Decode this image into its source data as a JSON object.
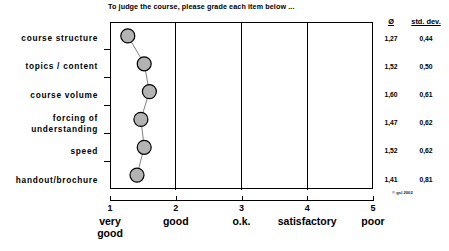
{
  "chart_data": {
    "type": "line",
    "title": "To judge the course, please grade each item below ...",
    "xlabel": "",
    "ylabel": "",
    "xlim": [
      1,
      5
    ],
    "grid": true,
    "legend": false,
    "orientation": "horizontal",
    "categories": [
      "course structure",
      "topics / content",
      "course volume",
      "forcing of understanding",
      "speed",
      "handout/brochure"
    ],
    "series": [
      {
        "name": "mean",
        "values": [
          1.27,
          1.52,
          1.6,
          1.47,
          1.52,
          1.41
        ]
      },
      {
        "name": "std. dev.",
        "values": [
          0.44,
          0.5,
          0.61,
          0.62,
          0.62,
          0.81
        ]
      }
    ],
    "x_ticks": [
      {
        "value": 1,
        "label": "1",
        "name_line1": "very",
        "name_line2": "good"
      },
      {
        "value": 2,
        "label": "2",
        "name_line1": "good",
        "name_line2": ""
      },
      {
        "value": 3,
        "label": "3",
        "name_line1": "o.k.",
        "name_line2": ""
      },
      {
        "value": 4,
        "label": "4",
        "name_line1": "satisfactory",
        "name_line2": ""
      },
      {
        "value": 5,
        "label": "5",
        "name_line1": "poor",
        "name_line2": ""
      }
    ],
    "annotations": [
      "© gsl 2002"
    ]
  },
  "table": {
    "headers": {
      "mean": "Ø",
      "std_dev": "std. dev."
    },
    "rows": [
      {
        "category": "course structure",
        "mean": "1,27",
        "std_dev": "0,44"
      },
      {
        "category": "topics / content",
        "mean": "1,52",
        "std_dev": "0,50"
      },
      {
        "category": "course volume",
        "mean": "1,60",
        "std_dev": "0,61"
      },
      {
        "category": "forcing of understanding",
        "mean": "1,47",
        "std_dev": "0,62"
      },
      {
        "category": "speed",
        "mean": "1,52",
        "std_dev": "0,62"
      },
      {
        "category": "handout/brochure",
        "mean": "1,41",
        "std_dev": "0,81"
      }
    ]
  },
  "labels": {
    "cat_0": "course structure",
    "cat_1": "topics / content",
    "cat_2": "course volume",
    "cat_3_line1": "forcing of",
    "cat_3_line2": "understanding",
    "cat_4": "speed",
    "cat_5": "handout/brochure"
  },
  "footer": {
    "copyright": "© gsl 2002"
  },
  "colors": {
    "marker_fill": "#b3b3b3",
    "marker_stroke": "#000000",
    "line": "#808080",
    "axis": "#000000",
    "background": "#ffffff"
  }
}
